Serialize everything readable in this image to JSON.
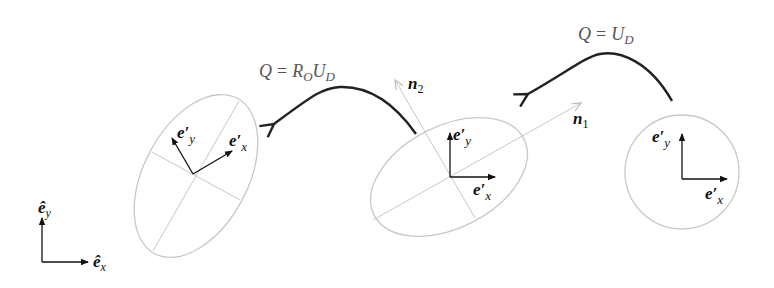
{
  "diagram": {
    "type": "deformation decomposition schematic",
    "transforms": [
      {
        "id": "stretch",
        "label_lhs": "Q",
        "label_eq": "=",
        "label_rhs": "U",
        "label_rhs_sub": "D"
      },
      {
        "id": "rotate_stretch",
        "label_lhs": "Q",
        "label_eq": "=",
        "label_rhs_R": "R",
        "label_rhs_R_sub": "O",
        "label_rhs_U": "U",
        "label_rhs_U_sub": "D"
      }
    ],
    "reference_frame": {
      "x_label": "ê",
      "x_sub": "x",
      "y_label": "ê",
      "y_sub": "y"
    },
    "shapes": {
      "circle": {
        "ex_label": "e′",
        "ex_sub": "x",
        "ey_label": "e′",
        "ey_sub": "y"
      },
      "stretched_ellipse": {
        "ex_label": "e′",
        "ex_sub": "x",
        "ey_label": "e′",
        "ey_sub": "y",
        "n1_label": "n",
        "n1_sub": "1",
        "n2_label": "n",
        "n2_sub": "2"
      },
      "rotated_ellipse": {
        "ex_label": "e′",
        "ex_sub": "x",
        "ey_label": "e′",
        "ey_sub": "y"
      }
    },
    "colors": {
      "outline": "#c8c8c8",
      "axis": "#111111",
      "transform_arrow": "#222222",
      "label_gray": "#555555"
    }
  }
}
